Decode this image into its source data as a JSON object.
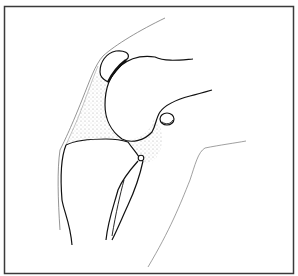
{
  "figure": {
    "caption": "",
    "colors": {
      "background": "#ffffff",
      "frame": "#3a3a3a",
      "bone_outline": "#111111",
      "soft_tissue_outline": "#777777",
      "stipple_fill": "#bdbdbd"
    },
    "structures": [
      {
        "id": "femur",
        "label": "femoral condyle"
      },
      {
        "id": "patella",
        "label": "patella"
      },
      {
        "id": "tibia",
        "label": "tibia"
      },
      {
        "id": "fibula",
        "label": "fibula"
      },
      {
        "id": "fabella",
        "label": "fabella (sesamoid)"
      },
      {
        "id": "joint-capsule-anterior",
        "label": "anterior joint space (stippled)"
      },
      {
        "id": "joint-capsule-posterior",
        "label": "posterior joint space (stippled)"
      },
      {
        "id": "skin-anterior",
        "label": "anterior skin contour"
      },
      {
        "id": "skin-posterior",
        "label": "posterior skin contour"
      }
    ]
  }
}
